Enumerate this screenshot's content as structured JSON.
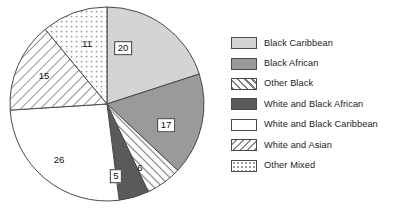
{
  "chart_data": {
    "type": "pie",
    "title": "",
    "subtitle": "",
    "xlabel": "",
    "ylabel": "",
    "grid": false,
    "legend_position": "right",
    "start_angle_deg": 0,
    "direction": "clockwise",
    "total": 100,
    "categories": [
      "Black Caribbean",
      "Black African",
      "Other Black",
      "White and Black African",
      "White and Black Caribbean",
      "White and Asian",
      "Other Mixed"
    ],
    "values": [
      20,
      17,
      6,
      5,
      26,
      15,
      11
    ],
    "labels": [
      "20",
      "17",
      "6",
      "5",
      "26",
      "15",
      "11"
    ],
    "slices": [
      {
        "name": "Black Caribbean",
        "value": 20,
        "label": "20",
        "fill": "#d4d4d4",
        "pattern": "solid",
        "label_boxed": true,
        "label_x": 123,
        "label_y": 48
      },
      {
        "name": "Black African",
        "value": 17,
        "label": "17",
        "fill": "#9a9a9a",
        "pattern": "solid",
        "label_boxed": true,
        "label_x": 166,
        "label_y": 125
      },
      {
        "name": "Other Black",
        "value": 6,
        "label": "6",
        "fill": "#ffffff",
        "pattern": "hatch-forward",
        "label_boxed": false,
        "label_x": 140,
        "label_y": 168
      },
      {
        "name": "White and Black African",
        "value": 5,
        "label": "5",
        "fill": "#5a5a5a",
        "pattern": "solid",
        "label_boxed": true,
        "label_x": 116,
        "label_y": 176
      },
      {
        "name": "White and Black Caribbean",
        "value": 26,
        "label": "26",
        "fill": "#ffffff",
        "pattern": "solid",
        "label_boxed": false,
        "label_x": 59,
        "label_y": 160
      },
      {
        "name": "White and Asian",
        "value": 15,
        "label": "15",
        "fill": "#ffffff",
        "pattern": "hatch-back",
        "label_boxed": false,
        "label_x": 44,
        "label_y": 76
      },
      {
        "name": "Other Mixed",
        "value": 11,
        "label": "11",
        "fill": "#ffffff",
        "pattern": "dots",
        "label_boxed": false,
        "label_x": 87,
        "label_y": 44
      }
    ]
  },
  "legend": {
    "items": [
      {
        "label": "Black Caribbean",
        "swatch": "solid-light-grey"
      },
      {
        "label": "Black African",
        "swatch": "solid-medium-grey"
      },
      {
        "label": "Other Black",
        "swatch": "hatch-forward"
      },
      {
        "label": "White and Black African",
        "swatch": "solid-dark-grey"
      },
      {
        "label": "White and Black Caribbean",
        "swatch": "solid-white"
      },
      {
        "label": "White and Asian",
        "swatch": "hatch-back"
      },
      {
        "label": "Other Mixed",
        "swatch": "dots"
      }
    ]
  },
  "colors": {
    "black_caribbean": "#d4d4d4",
    "black_african": "#9a9a9a",
    "white_and_black_african": "#5a5a5a",
    "white": "#ffffff",
    "outline": "#4a4a4a",
    "text": "#1a1a1a"
  }
}
